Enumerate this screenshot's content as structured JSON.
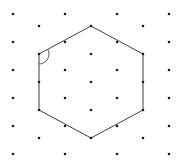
{
  "figure": {
    "width": 184,
    "height": 160,
    "background": "#ffffff",
    "dot_color": "#1c1c1c",
    "dot_radius": 1.3,
    "line_color": "#3f3f3f",
    "line_width": 1,
    "dot_columns": [
      {
        "x": 13,
        "ys": [
          14,
          42,
          70,
          98,
          126,
          154
        ]
      },
      {
        "x": 39,
        "ys": [
          26,
          54,
          82,
          110,
          138
        ]
      },
      {
        "x": 65,
        "ys": [
          14,
          42,
          70,
          98,
          126,
          154
        ]
      },
      {
        "x": 91,
        "ys": [
          26,
          54,
          82,
          110,
          138
        ]
      },
      {
        "x": 117,
        "ys": [
          14,
          42,
          70,
          98,
          126,
          154
        ]
      },
      {
        "x": 143,
        "ys": [
          26,
          54,
          82,
          110,
          138
        ]
      },
      {
        "x": 169,
        "ys": [
          14,
          42,
          70,
          98,
          126,
          154
        ]
      }
    ],
    "hexagon_vertices": [
      [
        91,
        26
      ],
      [
        143,
        54
      ],
      [
        143,
        110
      ],
      [
        91,
        138
      ],
      [
        39,
        110
      ],
      [
        39,
        54
      ]
    ],
    "angle_marker": {
      "vertex": [
        39,
        54
      ],
      "radius": 10,
      "start": [
        39,
        64
      ],
      "end": [
        47.81,
        49.26
      ],
      "large_arc": 0,
      "sweep": 0
    }
  }
}
